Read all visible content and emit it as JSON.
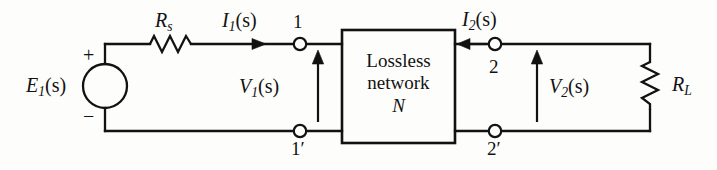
{
  "figure": {
    "background_color": "#fdfdfb",
    "line_color": "#121212",
    "text_color": "#121212"
  },
  "source": {
    "label_main": "E",
    "label_sub": "1",
    "label_arg": "(s)",
    "label_full": "E₁(s)",
    "plus_sign": "+",
    "minus_sign": "−",
    "symbol": "voltage-source-circle"
  },
  "series_resistor": {
    "label_main": "R",
    "label_sub": "s",
    "label_full": "Rₛ",
    "symbol": "zigzag-resistor-horizontal",
    "zigzag_peaks": 4
  },
  "load_resistor": {
    "label_main": "R",
    "label_sub": "L",
    "label_full": "Rₗ",
    "symbol": "zigzag-resistor-vertical",
    "zigzag_peaks": 4
  },
  "currents": [
    {
      "name": "input-current",
      "label_main": "I",
      "label_sub": "1",
      "label_arg": "(s)",
      "label_full": "I₁(s)",
      "direction": "right"
    },
    {
      "name": "output-current",
      "label_main": "I",
      "label_sub": "2",
      "label_arg": "(s)",
      "label_full": "I₂(s)",
      "direction": "left"
    }
  ],
  "voltages": [
    {
      "name": "input-voltage",
      "label_main": "V",
      "label_sub": "1",
      "label_arg": "(s)",
      "label_full": "V₁(s)",
      "direction": "up"
    },
    {
      "name": "output-voltage",
      "label_main": "V",
      "label_sub": "2",
      "label_arg": "(s)",
      "label_full": "V₂(s)",
      "direction": "up"
    }
  ],
  "network_box": {
    "line1": "Lossless",
    "line2": "network",
    "line3": "N"
  },
  "terminals": [
    {
      "name": "terminal-1",
      "label": "1"
    },
    {
      "name": "terminal-1p",
      "label": "1′"
    },
    {
      "name": "terminal-2",
      "label": "2"
    },
    {
      "name": "terminal-2p",
      "label": "2′"
    }
  ]
}
